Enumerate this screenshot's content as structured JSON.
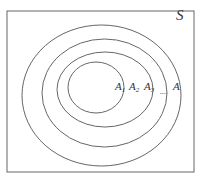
{
  "diagram": {
    "universe_label": "S",
    "sets": [
      {
        "label": "A",
        "sub": "1"
      },
      {
        "label": "A",
        "sub": "2"
      },
      {
        "label": "A",
        "sub": "3"
      },
      {
        "label": "A",
        "sub": ""
      }
    ],
    "ellipsis": "....",
    "colors": {
      "stroke": "#555555",
      "background": "#ffffff"
    }
  }
}
